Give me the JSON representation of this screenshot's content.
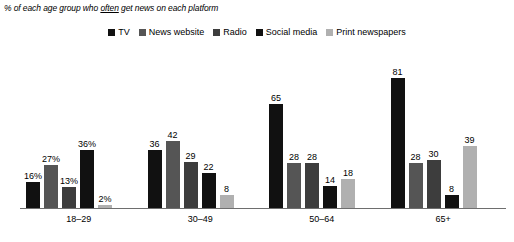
{
  "title": {
    "prefix": "% of each age group who ",
    "emphasis": "often",
    "suffix": " get news on each platform"
  },
  "legend": {
    "items": [
      {
        "label": "TV",
        "color": "#111111"
      },
      {
        "label": "News website",
        "color": "#555555"
      },
      {
        "label": "Radio",
        "color": "#3d3d3d"
      },
      {
        "label": "Social media",
        "color": "#111111"
      },
      {
        "label": "Print newspapers",
        "color": "#b0b0b0"
      }
    ]
  },
  "chart_data": {
    "type": "bar",
    "title": "% of each age group who often get news on each platform",
    "xlabel": "",
    "ylabel": "",
    "ylim": [
      0,
      90
    ],
    "grid": false,
    "legend_position": "top-center",
    "categories": [
      "18–29",
      "30–49",
      "50–64",
      "65+"
    ],
    "series": [
      {
        "name": "TV",
        "color": "#111111",
        "values": [
          16,
          36,
          65,
          81
        ],
        "labels": [
          "16%",
          "36",
          "65",
          "81"
        ]
      },
      {
        "name": "News website",
        "color": "#555555",
        "values": [
          27,
          42,
          28,
          28
        ],
        "labels": [
          "27%",
          "42",
          "28",
          "28"
        ]
      },
      {
        "name": "Radio",
        "color": "#3d3d3d",
        "values": [
          13,
          29,
          28,
          30
        ],
        "labels": [
          "13%",
          "29",
          "28",
          "30"
        ]
      },
      {
        "name": "Social media",
        "color": "#111111",
        "values": [
          36,
          22,
          14,
          8
        ],
        "labels": [
          "36%",
          "22",
          "14",
          "8"
        ]
      },
      {
        "name": "Print newspapers",
        "color": "#b0b0b0",
        "values": [
          2,
          8,
          18,
          39
        ],
        "labels": [
          "2%",
          "8",
          "18",
          "39"
        ]
      }
    ]
  }
}
